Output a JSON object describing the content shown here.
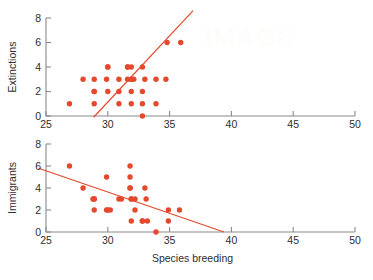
{
  "figure": {
    "accent_color": "#e4492d",
    "axis_color": "#8a8a8a",
    "text_color": "#2e2e2e",
    "watermark_text": "IMAGE"
  },
  "chart_data": [
    {
      "type": "scatter",
      "id": "extinctions-vs-species-breeding",
      "title": "",
      "xlabel": "",
      "ylabel": "Extinctions",
      "xlim": [
        25,
        50
      ],
      "ylim": [
        0,
        8
      ],
      "xticks": [
        25,
        30,
        35,
        40,
        45,
        50
      ],
      "yticks": [
        0,
        2,
        4,
        6,
        8
      ],
      "xticklabels": [
        "25",
        "30",
        "35",
        "40",
        "45",
        "50"
      ],
      "yticklabels": [
        "0",
        "2",
        "4",
        "6",
        "8"
      ],
      "grid": false,
      "legend": "none",
      "marker": "filled-circle",
      "x": [
        26.9,
        28.0,
        28.9,
        28.9,
        28.9,
        28.9,
        29.9,
        30.0,
        30.0,
        30.0,
        30.9,
        30.9,
        30.9,
        31.6,
        31.6,
        31.6,
        31.9,
        31.9,
        31.9,
        31.9,
        31.9,
        32.1,
        32.8,
        32.8,
        32.8,
        32.8,
        33.0,
        33.9,
        33.9,
        34.7,
        34.8,
        35.9
      ],
      "y": [
        1,
        3,
        3,
        2,
        2,
        1,
        3,
        4,
        4,
        2,
        3,
        2,
        1,
        4,
        4,
        3,
        4,
        3,
        3,
        2,
        1,
        3,
        4,
        2,
        1,
        0,
        3,
        3,
        1,
        3,
        6,
        6
      ],
      "fit_line": {
        "x": [
          28.85,
          36.9
        ],
        "y": [
          -0.1,
          8.6
        ],
        "style": "solid"
      }
    },
    {
      "type": "scatter",
      "id": "immigrants-vs-species-breeding",
      "title": "",
      "xlabel": "Species breeding",
      "ylabel": "Immigrants",
      "xlim": [
        25,
        50
      ],
      "ylim": [
        0,
        8
      ],
      "xticks": [
        25,
        30,
        35,
        40,
        45,
        50
      ],
      "yticks": [
        0,
        2,
        4,
        6,
        8
      ],
      "xticklabels": [
        "25",
        "30",
        "35",
        "40",
        "45",
        "50"
      ],
      "yticklabels": [
        "0",
        "2",
        "4",
        "6",
        "8"
      ],
      "grid": false,
      "legend": "none",
      "marker": "filled-circle",
      "x": [
        26.9,
        28.0,
        28.8,
        28.9,
        28.9,
        28.9,
        29.9,
        29.9,
        30.0,
        30.2,
        30.9,
        31.1,
        31.8,
        31.8,
        31.8,
        31.8,
        31.9,
        31.9,
        31.9,
        32.2,
        32.2,
        32.8,
        32.8,
        33.0,
        33.1,
        33.2,
        33.9,
        34.9,
        34.9,
        35.8
      ],
      "y": [
        6,
        4,
        3,
        3,
        3,
        2,
        5,
        2,
        2,
        2,
        3,
        3,
        6,
        5,
        4,
        4,
        3,
        3,
        1,
        3,
        2,
        1,
        1,
        4,
        3,
        1,
        0,
        2,
        1,
        2
      ],
      "fit_line": {
        "x": [
          24.4,
          39.4
        ],
        "y": [
          5.8,
          0.0
        ],
        "style": "solid"
      }
    }
  ]
}
